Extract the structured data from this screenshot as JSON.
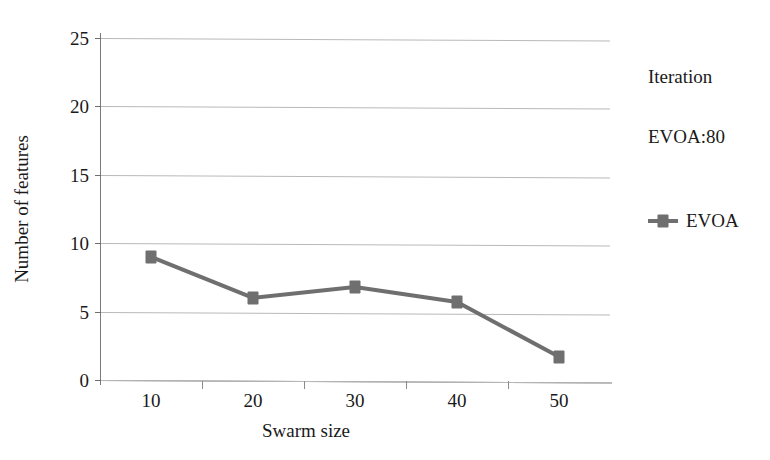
{
  "chart_data": {
    "type": "line",
    "title": "",
    "xlabel": "Swarm size",
    "ylabel": "Number of features",
    "categories": [
      "10",
      "20",
      "30",
      "40",
      "50"
    ],
    "xticklabels": [
      "10",
      "20",
      "30",
      "40",
      "50"
    ],
    "yticklabels": [
      "0",
      "5",
      "10",
      "15",
      "20",
      "25"
    ],
    "ylim": [
      0,
      25
    ],
    "ytick_step": 5,
    "grid": true,
    "legend_position": "right",
    "series": [
      {
        "name": "EVOA",
        "values": [
          9.0,
          6.0,
          6.8,
          5.7,
          1.7
        ],
        "color": "#6f6f6f",
        "marker": "square"
      }
    ]
  },
  "axes": {
    "y_title": "Number of features",
    "x_title": "Swarm size",
    "y_ticks": [
      {
        "label": "25",
        "value": 25
      },
      {
        "label": "20",
        "value": 20
      },
      {
        "label": "15",
        "value": 15
      },
      {
        "label": "10",
        "value": 10
      },
      {
        "label": "5",
        "value": 5
      },
      {
        "label": "0",
        "value": 0
      }
    ],
    "x_ticks": [
      {
        "label": "10"
      },
      {
        "label": "20"
      },
      {
        "label": "30"
      },
      {
        "label": "40"
      },
      {
        "label": "50"
      }
    ]
  },
  "legend": {
    "title": "Iteration",
    "subtitle": "EVOA:80",
    "entries": [
      {
        "label": "EVOA",
        "color": "#6f6f6f",
        "marker": "square-line-marker"
      }
    ]
  },
  "style": {
    "series_color": "#6f6f6f",
    "grid_color": "#b9b9b9",
    "axis_color": "#7a7a7a",
    "text_color": "#1a1a1a",
    "background": "#ffffff"
  }
}
